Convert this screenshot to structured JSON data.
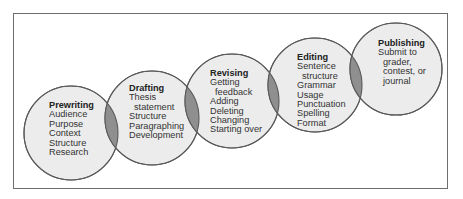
{
  "diagram": {
    "type": "overlapping-circles-process",
    "colors": {
      "circle_fill": "#ececec",
      "circle_stroke": "#5a5a5a",
      "overlap_fill": "#8f8f8f",
      "frame_stroke": "#6e6e6e",
      "text": "#333333"
    },
    "stages": [
      {
        "title": "Prewriting",
        "items": [
          "Audience",
          "Purpose",
          "Context",
          "Structure",
          "Research"
        ]
      },
      {
        "title": "Drafting",
        "items": [
          "Thesis",
          "statement",
          "Structure",
          "Paragraphing",
          "Development"
        ]
      },
      {
        "title": "Revising",
        "items": [
          "Getting",
          "feedback",
          "Adding",
          "Deleting",
          "Changing",
          "Starting over"
        ]
      },
      {
        "title": "Editing",
        "items": [
          "Sentence",
          "structure",
          "Grammar",
          "Usage",
          "Punctuation",
          "Spelling",
          "Format"
        ]
      },
      {
        "title": "Publishing",
        "items": [
          "Submit to",
          "grader,",
          "contest, or",
          "journal"
        ]
      }
    ]
  }
}
